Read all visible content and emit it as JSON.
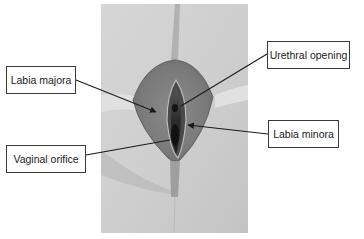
{
  "figure": {
    "labels": [
      {
        "id": "labia-majora",
        "text": "Labia majora",
        "side": "left"
      },
      {
        "id": "vaginal-orifice",
        "text": "Vaginal orifice",
        "side": "left"
      },
      {
        "id": "urethral-opening",
        "text": "Urethral opening",
        "side": "right"
      },
      {
        "id": "labia-minora",
        "text": "Labia minora",
        "side": "right"
      }
    ]
  },
  "colors": {
    "background": "#ffffff",
    "label_border": "#3a3a3a",
    "label_text": "#222222",
    "leader_line": "#1a1a1a"
  }
}
